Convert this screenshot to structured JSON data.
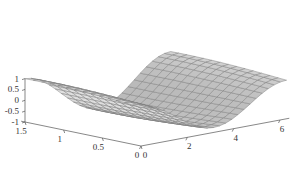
{
  "chart_data": {
    "type": "surface3d",
    "title": "",
    "xlabel": "",
    "ylabel": "",
    "zlabel": "",
    "function": "z = cos(x) * cos(pi*y/3) ... approx: cos-shaped trough along x",
    "x_range": [
      0,
      6.2832
    ],
    "y_range": [
      0,
      1.5
    ],
    "z_range": [
      -1,
      1
    ],
    "x_ticks": [
      "0",
      "2",
      "4",
      "6"
    ],
    "y_ticks": [
      "0",
      "0.5",
      "1",
      "1.5"
    ],
    "z_ticks": [
      "-1",
      "-0.5",
      "0",
      "0.5",
      "1"
    ],
    "x_tick_values": [
      0,
      2,
      4,
      6
    ],
    "y_tick_values": [
      0,
      0.5,
      1,
      1.5
    ],
    "z_tick_values": [
      -1,
      -0.5,
      0,
      0.5,
      1
    ],
    "grid_x": 24,
    "grid_y": 14,
    "face_color": "#c8c8c8",
    "edge_color": "#7a7a7a",
    "grid": false,
    "legend": "none"
  }
}
